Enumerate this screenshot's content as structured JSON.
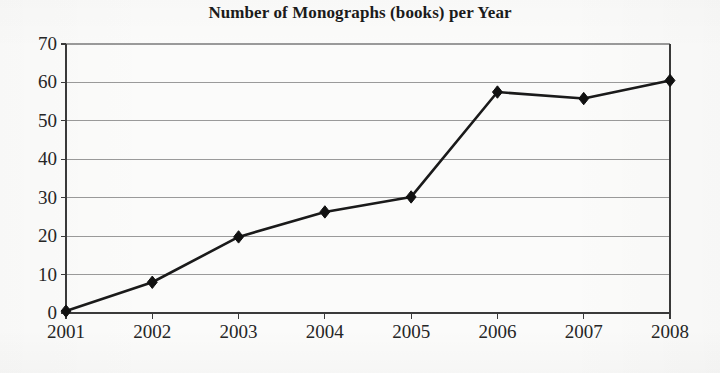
{
  "chart_data": {
    "type": "line",
    "title": "Number of Monographs (books) per Year",
    "xlabel": "",
    "ylabel": "",
    "categories": [
      "2001",
      "2002",
      "2003",
      "2004",
      "2005",
      "2006",
      "2007",
      "2008"
    ],
    "values": [
      0.5,
      8,
      19.8,
      26.3,
      30.2,
      57.5,
      55.8,
      60.5
    ],
    "series": [
      {
        "name": "Monographs",
        "values": [
          0.5,
          8,
          19.8,
          26.3,
          30.2,
          57.5,
          55.8,
          60.5
        ]
      }
    ],
    "ylim": [
      0,
      70
    ],
    "ytick_labels": [
      "0",
      "10",
      "20",
      "30",
      "40",
      "50",
      "60",
      "70"
    ],
    "ytick_values": [
      0,
      10,
      20,
      30,
      40,
      50,
      60,
      70
    ],
    "xtick_labels": [
      "2001",
      "2002",
      "2003",
      "2004",
      "2005",
      "2006",
      "2007",
      "2008"
    ],
    "grid": true,
    "grid_axis": "y",
    "legend": false,
    "legend_position": "none",
    "marker": "diamond",
    "line_color": "#1a1a1a",
    "marker_color": "#111111",
    "grid_color": "#9a9a9a",
    "axis_color": "#3a3a3a",
    "background_color": "#fbfbfa",
    "text_color": "#262626"
  },
  "axes": {
    "y_labels": [
      {
        "text": "70",
        "value": 70
      },
      {
        "text": "60",
        "value": 60
      },
      {
        "text": "50",
        "value": 50
      },
      {
        "text": "40",
        "value": 40
      },
      {
        "text": "30",
        "value": 30
      },
      {
        "text": "20",
        "value": 20
      },
      {
        "text": "10",
        "value": 10
      },
      {
        "text": "0",
        "value": 0
      }
    ],
    "x_labels": [
      {
        "text": "2001"
      },
      {
        "text": "2002"
      },
      {
        "text": "2003"
      },
      {
        "text": "2004"
      },
      {
        "text": "2005"
      },
      {
        "text": "2006"
      },
      {
        "text": "2007"
      },
      {
        "text": "2008"
      }
    ]
  }
}
